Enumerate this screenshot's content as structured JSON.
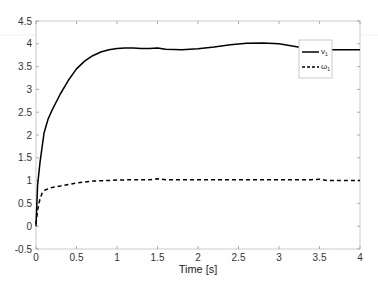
{
  "chart_data": {
    "type": "line",
    "title": "",
    "xlabel": "Time [s]",
    "ylabel": "",
    "xlim": [
      0,
      4
    ],
    "ylim": [
      -0.5,
      4.5
    ],
    "grid": false,
    "legend_position": "upper right (inside)",
    "x_ticks": [
      "0",
      "0.5",
      "1",
      "1.5",
      "2",
      "2.5",
      "3",
      "3.5",
      "4"
    ],
    "y_ticks": [
      "-0.5",
      "0",
      "0.5",
      "1",
      "1.5",
      "2",
      "2.5",
      "3",
      "3.5",
      "4",
      "4.5"
    ],
    "series": [
      {
        "name": "v1",
        "label": "v",
        "label_sub": "1",
        "style": "solid",
        "color": "#000000",
        "x": [
          0,
          0.02,
          0.05,
          0.1,
          0.15,
          0.2,
          0.3,
          0.4,
          0.5,
          0.6,
          0.7,
          0.8,
          0.9,
          1.0,
          1.1,
          1.2,
          1.3,
          1.4,
          1.5,
          1.6,
          1.8,
          2.0,
          2.2,
          2.4,
          2.6,
          2.8,
          3.0,
          3.2,
          3.4,
          3.6,
          3.8,
          4.0
        ],
        "values": [
          0,
          0.9,
          1.4,
          2.05,
          2.35,
          2.55,
          2.9,
          3.2,
          3.45,
          3.62,
          3.74,
          3.82,
          3.87,
          3.9,
          3.91,
          3.91,
          3.9,
          3.9,
          3.91,
          3.88,
          3.87,
          3.89,
          3.93,
          3.98,
          4.01,
          4.02,
          4.0,
          3.94,
          3.88,
          3.87,
          3.87,
          3.87
        ]
      },
      {
        "name": "omega1",
        "label": "ω",
        "label_sub": "1",
        "style": "dashed",
        "color": "#000000",
        "x": [
          0,
          0.02,
          0.05,
          0.08,
          0.12,
          0.2,
          0.3,
          0.5,
          0.7,
          1.0,
          1.2,
          1.4,
          1.5,
          1.6,
          2.0,
          2.5,
          3.0,
          3.4,
          3.5,
          3.6,
          4.0
        ],
        "values": [
          0.05,
          0.35,
          0.6,
          0.75,
          0.8,
          0.85,
          0.88,
          0.95,
          0.99,
          1.01,
          1.02,
          1.02,
          1.04,
          1.02,
          1.02,
          1.02,
          1.02,
          1.02,
          1.03,
          1.0,
          1.0
        ]
      }
    ]
  }
}
